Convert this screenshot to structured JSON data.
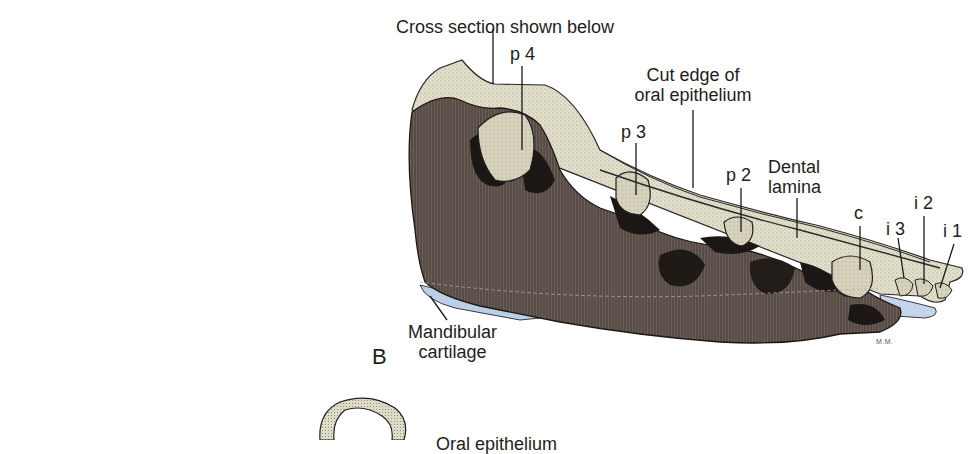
{
  "figure": {
    "panel_letter": "B",
    "signature": "M.M.",
    "colors": {
      "bone_dark": "#5e514b",
      "bone_mid": "#7d706a",
      "epithelium_fill": "#ddd9c4",
      "tooth_fill": "#d4d0ba",
      "cartilage_blue": "#b9cde6",
      "line": "#1a1a1a"
    },
    "labels": {
      "cross_section": "Cross section shown below",
      "p4": "p 4",
      "cut_edge_line1": "Cut edge of",
      "cut_edge_line2": "oral epithelium",
      "p3": "p 3",
      "p2": "p 2",
      "dental_lamina_line1": "Dental",
      "dental_lamina_line2": "lamina",
      "c": "c",
      "i3": "i 3",
      "i2": "i 2",
      "i1": "i 1",
      "mandibular_line1": "Mandibular",
      "mandibular_line2": "cartilage",
      "partial_bottom_label": "Oral epithelium"
    }
  }
}
